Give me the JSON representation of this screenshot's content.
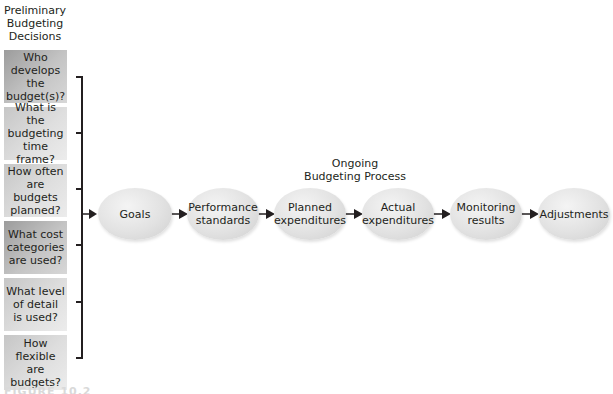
{
  "left_heading": [
    "Preliminary",
    "Budgeting",
    "Decisions"
  ],
  "questions": [
    {
      "lines": [
        "Who",
        "develops the",
        "budget(s)?"
      ],
      "shade": "dark"
    },
    {
      "lines": [
        "What is the",
        "budgeting",
        "time frame?"
      ],
      "shade": "light"
    },
    {
      "lines": [
        "How often",
        "are budgets",
        "planned?"
      ],
      "shade": "light"
    },
    {
      "lines": [
        "What cost",
        "categories",
        "are used?"
      ],
      "shade": "dark"
    },
    {
      "lines": [
        "What level",
        "of detail",
        "is used?"
      ],
      "shade": "light"
    },
    {
      "lines": [
        "How flexible",
        "are budgets?"
      ],
      "shade": "light"
    }
  ],
  "process_heading": [
    "Ongoing",
    "Budgeting Process"
  ],
  "steps": [
    {
      "lines": [
        "Goals"
      ]
    },
    {
      "lines": [
        "Performance",
        "standards"
      ]
    },
    {
      "lines": [
        "Planned",
        "expenditures"
      ]
    },
    {
      "lines": [
        "Actual",
        "expenditures"
      ]
    },
    {
      "lines": [
        "Monitoring",
        "results"
      ]
    },
    {
      "lines": [
        "Adjustments"
      ]
    }
  ],
  "figure_label": "FIGURE 10.2",
  "colors": {
    "line": "#231f20",
    "box_dark": "#a8a8a8",
    "box_light": "#d6d6d6",
    "ellipse": "#e2e2e2"
  }
}
